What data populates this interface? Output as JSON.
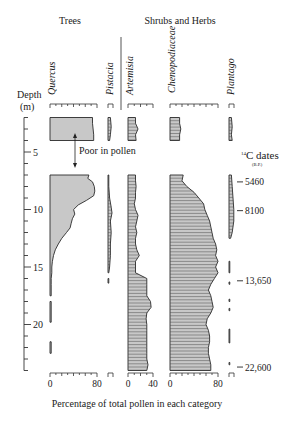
{
  "chart_data": {
    "type": "area",
    "title": "",
    "group_labels": [
      {
        "label": "Trees",
        "x": 70
      },
      {
        "label": "Shrubs and Herbs",
        "x": 180
      }
    ],
    "ylabel": "Depth (m)",
    "ylabel_line1": "Depth",
    "ylabel_line2": "(m)",
    "xlabel": "Percentage of total pollen in each category",
    "y_ticks": [
      5,
      10,
      15,
      20
    ],
    "ylim": [
      2,
      24
    ],
    "gap_annotation": "Poor in pollen",
    "c14_header": "14C dates",
    "c14_header_sup": "14",
    "c14_header_main": "C dates",
    "c14_header_sub": "(B.P.)",
    "c14_dates": [
      {
        "label": "5460",
        "depth": 7.6
      },
      {
        "label": "8100",
        "depth": 10.1
      },
      {
        "label": "13,650",
        "depth": 16.2
      },
      {
        "label": "22,600",
        "depth": 23.7
      }
    ],
    "series": [
      {
        "name": "Quercus",
        "group": "Trees",
        "axis_max": 80,
        "axis_labels": [
          "0",
          "80"
        ],
        "segments": [
          {
            "depths": [
              2.0,
              2.5,
              3.0,
              3.5,
              4.0
            ],
            "values": [
              72,
              72,
              73,
              74,
              74
            ]
          },
          {
            "depths": [
              7.0,
              7.3,
              7.6,
              8.0,
              8.4,
              8.8,
              9.2,
              9.6,
              10.0,
              10.4,
              10.8,
              11.2,
              11.6,
              12.0,
              12.5,
              13.0,
              13.5,
              14.0,
              14.5,
              15.0,
              15.5,
              16.0,
              16.5,
              17.0,
              17.5
            ],
            "values": [
              66,
              64,
              72,
              75,
              76,
              74,
              62,
              48,
              40,
              42,
              38,
              36,
              34,
              28,
              20,
              14,
              9,
              6,
              4,
              3,
              3,
              2,
              2,
              2,
              2
            ]
          },
          {
            "depths": [
              18.0,
              19.8
            ],
            "values": [
              2,
              2
            ]
          },
          {
            "depths": [
              21.5,
              22.5
            ],
            "values": [
              2,
              2
            ]
          }
        ]
      },
      {
        "name": "Pistacia",
        "group": "Trees",
        "axis_max": 5,
        "axis_labels": [],
        "segments": [
          {
            "depths": [
              2.0,
              2.8,
              3.5,
              4.0
            ],
            "values": [
              3,
              4,
              3,
              2
            ]
          },
          {
            "depths": [
              7.0,
              8.0,
              9.0,
              9.8,
              10.3,
              11.0,
              12.0,
              13.0,
              14.0,
              15.0,
              15.5
            ],
            "values": [
              1,
              1,
              2,
              4,
              5,
              3,
              4,
              3,
              3,
              2,
              1
            ]
          },
          {
            "depths": [
              16.0,
              16.4
            ],
            "values": [
              1,
              1
            ]
          }
        ]
      },
      {
        "name": "Artemisia",
        "group": "Shrubs and Herbs",
        "axis_max": 40,
        "axis_labels": [
          "0",
          "40"
        ],
        "segments": [
          {
            "depths": [
              2.0,
              2.5,
              3.0,
              3.5,
              4.0
            ],
            "values": [
              12,
              12,
              16,
              12,
              13
            ]
          },
          {
            "depths": [
              7.0,
              7.5,
              8.0,
              8.5,
              9.0,
              9.5,
              10.0,
              10.5,
              11.0,
              11.5,
              12.0,
              12.5,
              13.0,
              13.5,
              14.0,
              14.5,
              15.0,
              15.5,
              16.0,
              16.5,
              17.0,
              17.5,
              18.0,
              18.5,
              19.0,
              19.5,
              20.0,
              20.5,
              21.0,
              21.5,
              22.0,
              22.5,
              23.0,
              23.5,
              24.0
            ],
            "values": [
              12,
              12,
              13,
              12,
              12,
              10,
              12,
              16,
              14,
              12,
              14,
              12,
              12,
              14,
              18,
              12,
              12,
              12,
              30,
              30,
              30,
              30,
              36,
              37,
              30,
              29,
              30,
              30,
              30,
              30,
              30,
              30,
              30,
              32,
              30
            ]
          }
        ]
      },
      {
        "name": "Chenopodiaceae",
        "group": "Shrubs and Herbs",
        "axis_max": 80,
        "axis_labels": [
          "0",
          "80"
        ],
        "segments": [
          {
            "depths": [
              2.0,
              2.5,
              3.0,
              3.5,
              4.0
            ],
            "values": [
              16,
              16,
              18,
              16,
              16
            ]
          },
          {
            "depths": [
              7.0,
              7.5,
              8.0,
              8.5,
              9.0,
              9.5,
              10.0,
              10.5,
              11.0,
              11.5,
              12.0,
              12.5,
              13.0,
              13.5,
              14.0,
              14.5,
              15.0,
              15.5,
              16.0,
              16.5,
              17.0,
              17.5,
              18.0,
              18.5,
              19.0,
              19.5,
              20.0,
              20.5,
              21.0,
              21.5,
              22.0,
              22.5,
              23.0,
              23.5,
              24.0
            ],
            "values": [
              22,
              20,
              28,
              40,
              48,
              56,
              58,
              62,
              66,
              68,
              70,
              72,
              76,
              78,
              76,
              80,
              76,
              80,
              74,
              68,
              64,
              68,
              70,
              72,
              68,
              62,
              60,
              64,
              66,
              66,
              64,
              64,
              66,
              68,
              68
            ]
          }
        ]
      },
      {
        "name": "Plantago",
        "group": "Shrubs and Herbs",
        "axis_max": 5,
        "axis_labels": [],
        "segments": [
          {
            "depths": [
              2.0,
              2.8,
              3.5,
              4.0
            ],
            "values": [
              3,
              4,
              3,
              4
            ]
          },
          {
            "depths": [
              7.0,
              8.0,
              9.0,
              10.0,
              11.0,
              12.0,
              12.5
            ],
            "values": [
              3,
              4,
              5,
              6,
              6,
              4,
              2
            ]
          },
          {
            "depths": [
              14.5,
              15.5
            ],
            "values": [
              1,
              1
            ]
          },
          {
            "depths": [
              16.3,
              16.5
            ],
            "values": [
              1,
              1
            ]
          },
          {
            "depths": [
              17.8,
              18.0
            ],
            "values": [
              1,
              1
            ]
          },
          {
            "depths": [
              18.6,
              18.8
            ],
            "values": [
              1,
              1
            ]
          },
          {
            "depths": [
              20.4,
              21.6
            ],
            "values": [
              1,
              1
            ]
          },
          {
            "depths": [
              23.3,
              23.5
            ],
            "values": [
              1,
              1
            ]
          }
        ]
      }
    ],
    "colors": {
      "fill": "#c8c8c8",
      "line": "#2a2a2a",
      "hatch": "#4a4a4a"
    }
  }
}
